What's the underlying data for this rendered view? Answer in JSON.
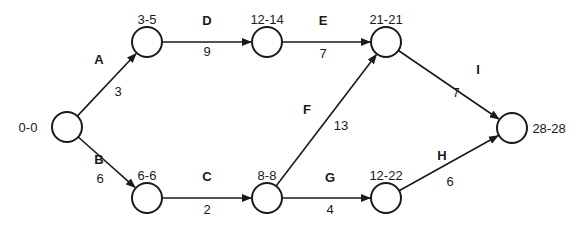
{
  "diagram": {
    "type": "activity-on-arrow network",
    "nodes": [
      {
        "id": "n0",
        "label": "0-0",
        "x": 67,
        "y": 127,
        "label_x": 28,
        "label_y": 132,
        "anchor": "middle"
      },
      {
        "id": "n1",
        "label": "3-5",
        "x": 147,
        "y": 42,
        "label_x": 147,
        "label_y": 24,
        "anchor": "middle"
      },
      {
        "id": "n2",
        "label": "6-6",
        "x": 147,
        "y": 198,
        "label_x": 147,
        "label_y": 180,
        "anchor": "middle"
      },
      {
        "id": "n3",
        "label": "12-14",
        "x": 267,
        "y": 42,
        "label_x": 267,
        "label_y": 24,
        "anchor": "middle"
      },
      {
        "id": "n4",
        "label": "8-8",
        "x": 267,
        "y": 198,
        "label_x": 267,
        "label_y": 180,
        "anchor": "middle"
      },
      {
        "id": "n5",
        "label": "21-21",
        "x": 386,
        "y": 42,
        "label_x": 386,
        "label_y": 24,
        "anchor": "middle"
      },
      {
        "id": "n6",
        "label": "12-22",
        "x": 386,
        "y": 198,
        "label_x": 386,
        "label_y": 180,
        "anchor": "middle"
      },
      {
        "id": "n7",
        "label": "28-28",
        "x": 512,
        "y": 128,
        "label_x": 549,
        "label_y": 133,
        "anchor": "middle"
      }
    ],
    "activities": [
      {
        "name": "A",
        "duration": "3",
        "from": "n0",
        "to": "n1",
        "name_x": 99,
        "name_y": 64,
        "dur_x": 118,
        "dur_y": 96
      },
      {
        "name": "B",
        "duration": "6",
        "from": "n0",
        "to": "n2",
        "name_x": 99,
        "name_y": 164,
        "dur_x": 100,
        "dur_y": 183
      },
      {
        "name": "D",
        "duration": "9",
        "from": "n1",
        "to": "n3",
        "name_x": 207,
        "name_y": 25,
        "dur_x": 207,
        "dur_y": 56
      },
      {
        "name": "C",
        "duration": "2",
        "from": "n2",
        "to": "n4",
        "name_x": 207,
        "name_y": 181,
        "dur_x": 207,
        "dur_y": 214
      },
      {
        "name": "E",
        "duration": "7",
        "from": "n3",
        "to": "n5",
        "name_x": 323,
        "name_y": 25,
        "dur_x": 323,
        "dur_y": 58
      },
      {
        "name": "F",
        "duration": "13",
        "from": "n4",
        "to": "n5",
        "name_x": 307,
        "name_y": 114,
        "dur_x": 341,
        "dur_y": 130
      },
      {
        "name": "G",
        "duration": "4",
        "from": "n4",
        "to": "n6",
        "name_x": 330,
        "name_y": 182,
        "dur_x": 330,
        "dur_y": 214
      },
      {
        "name": "I",
        "duration": "7",
        "from": "n5",
        "to": "n7",
        "name_x": 478,
        "name_y": 74,
        "dur_x": 456,
        "dur_y": 97
      },
      {
        "name": "H",
        "duration": "6",
        "from": "n6",
        "to": "n7",
        "name_x": 442,
        "name_y": 160,
        "dur_x": 450,
        "dur_y": 186
      }
    ],
    "node_radius": 15,
    "colors": {
      "stroke": "#1a1a1a",
      "background": "#ffffff"
    }
  }
}
